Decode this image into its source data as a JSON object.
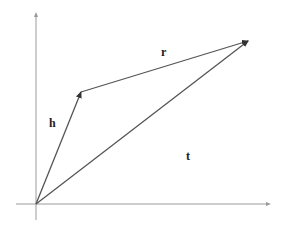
{
  "diagram": {
    "type": "vector-addition",
    "points": {
      "origin": {
        "name": "O"
      },
      "h_tip": {
        "name": "H"
      },
      "t_tip": {
        "name": "T"
      }
    },
    "vectors": [
      {
        "id": "h",
        "label": "h",
        "from": "origin",
        "to": "h_tip"
      },
      {
        "id": "r",
        "label": "r",
        "from": "h_tip",
        "to": "t_tip"
      },
      {
        "id": "t",
        "label": "t",
        "from": "origin",
        "to": "t_tip"
      }
    ],
    "relation": "t = h + r",
    "axes": {
      "x": true,
      "y": true
    }
  }
}
